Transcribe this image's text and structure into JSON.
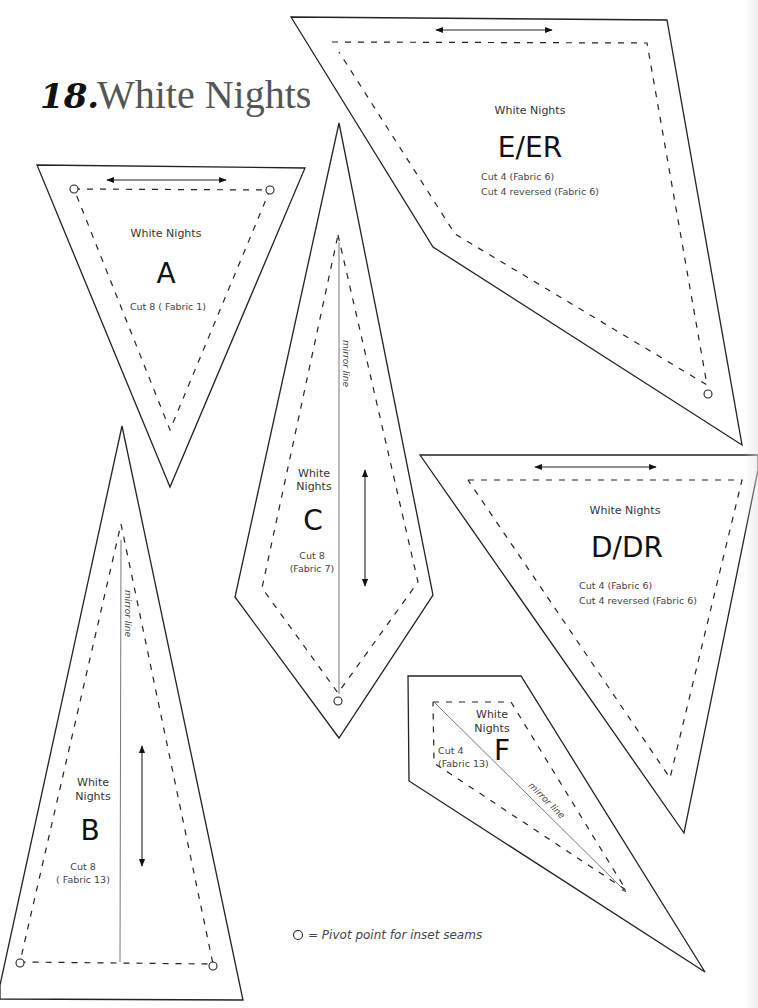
{
  "title": {
    "number": "18.",
    "text": "White Nights"
  },
  "legend": {
    "symbol": "○",
    "text": "= Pivot point for inset seams"
  },
  "mirror_label": "mirror line",
  "pieces": {
    "E": {
      "name": "White Nights",
      "letter": "E/ER",
      "cut1": "Cut 4 (Fabric 6)",
      "cut2": "Cut 4 reversed (Fabric 6)"
    },
    "A": {
      "name": "White Nights",
      "letter": "A",
      "cut1": "Cut 8 ( Fabric 1)"
    },
    "C": {
      "name1": "White",
      "name2": "Nights",
      "letter": "C",
      "cut1": "Cut 8",
      "cut2": "(Fabric 7)"
    },
    "D": {
      "name": "White Nights",
      "letter": "D/DR",
      "cut1": "Cut 4 (Fabric 6)",
      "cut2": "Cut 4 reversed (Fabric 6)"
    },
    "B": {
      "name1": "White",
      "name2": "Nights",
      "letter": "B",
      "cut1": "Cut 8",
      "cut2": "( Fabric 13)"
    },
    "F": {
      "name1": "White",
      "name2": "Nights",
      "letter": "F",
      "cut1": "Cut 4",
      "cut2": "(Fabric 13)"
    }
  }
}
